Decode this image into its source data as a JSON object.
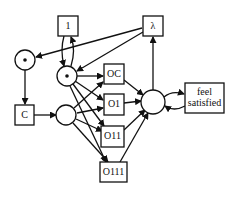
{
  "diagram": {
    "type": "petri-net",
    "places": [
      {
        "id": "p_left",
        "marked": true
      },
      {
        "id": "p_mid",
        "marked": true
      },
      {
        "id": "p_bottom",
        "marked": false
      },
      {
        "id": "p_right",
        "marked": false
      }
    ],
    "transitions": [
      {
        "id": "t_1",
        "label": "1"
      },
      {
        "id": "t_lambda",
        "label": "λ"
      },
      {
        "id": "t_C",
        "label": "C"
      },
      {
        "id": "t_OC",
        "label": "OC"
      },
      {
        "id": "t_O1",
        "label": "O1"
      },
      {
        "id": "t_O11",
        "label": "O11"
      },
      {
        "id": "t_O111",
        "label": "O111"
      },
      {
        "id": "t_feel",
        "label_line1": "feel",
        "label_line2": "satisfied"
      }
    ],
    "colors": {
      "stroke": "#111111",
      "background": "#ffffff"
    }
  }
}
